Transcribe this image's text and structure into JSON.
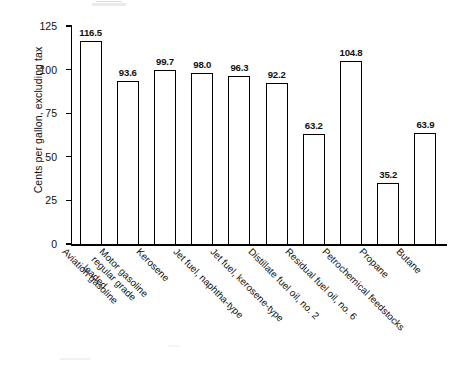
{
  "chart_data": {
    "type": "bar",
    "title": "",
    "subtitle": "",
    "xlabel": "",
    "ylabel": "Cents per gallon, excluding tax",
    "ylim": [
      0,
      125
    ],
    "yticks": [
      0,
      25,
      50,
      75,
      100,
      125
    ],
    "ytick_labels": [
      "0",
      "25",
      "50",
      "75",
      "100",
      "125"
    ],
    "grid": false,
    "legend": false,
    "legend_position": "none",
    "bar_style": {
      "fill": "#ffffff",
      "edge": "#000000",
      "value_labels": true
    },
    "categories": [
      "Aviation gasoline",
      "Motor gasoline\nregular grade\nleaded",
      "Kerosene",
      "Jet fuel, naphtha-type",
      "Jet fuel, kerosene-type",
      "Distillate fuel oil, no. 2",
      "Residual fuel oil, no. 6",
      "Petrochemical feedstocks",
      "Propane",
      "Butane"
    ],
    "values": [
      116.5,
      93.6,
      99.7,
      98.0,
      96.3,
      92.2,
      63.2,
      104.8,
      35.2,
      63.9
    ],
    "value_labels": [
      "116.5",
      "93.6",
      "99.7",
      "98.0",
      "96.3",
      "92.2",
      "63.2",
      "104.8",
      "35.2",
      "63.9"
    ]
  }
}
